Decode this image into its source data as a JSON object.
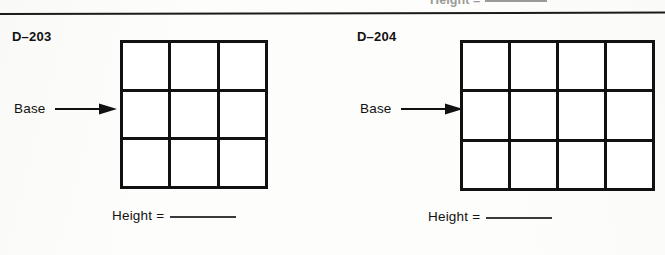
{
  "page": {
    "clipped_top_row": {
      "text": "Height =",
      "note": "partially cut off above the divider"
    }
  },
  "exercises": [
    {
      "code": "D–203",
      "base_label": "Base",
      "arrow_icon": "arrow-right-icon",
      "height_label": "Height =",
      "height_value": "",
      "grid": {
        "columns": 3,
        "rows": 3,
        "cell_count": 9
      }
    },
    {
      "code": "D–204",
      "base_label": "Base",
      "arrow_icon": "arrow-right-icon",
      "height_label": "Height =",
      "height_value": "",
      "grid": {
        "columns": 4,
        "rows": 3,
        "cell_count": 12
      }
    }
  ],
  "colors": {
    "ink": "#111111",
    "paper": "#fdfdfb",
    "blank_line": "#3a3a3a",
    "faded_ink": "#9a9a9a"
  }
}
